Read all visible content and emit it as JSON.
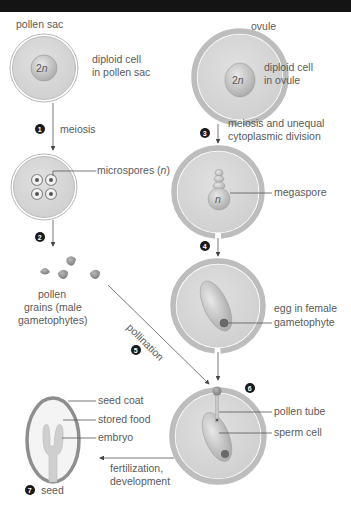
{
  "diagram": {
    "colors": {
      "cell_fill": "#d6d6d6",
      "wall": "#b4b4b4",
      "nucleus": "#c2c2c2",
      "dark": "#6a6a6a",
      "text": "#5a5a5a",
      "badge": "#1a1a1a",
      "top_band": "#141414"
    },
    "left_column": {
      "pollen_sac_label": "pollen sac",
      "diploid_cell_label_line1": "diploid cell",
      "diploid_cell_label_line2": "in pollen sac",
      "nucleus_label": "2",
      "nucleus_label_n": "n",
      "step1_badge": "1",
      "step1_label": "meiosis",
      "microspores_label": "microspores (",
      "microspores_n": "n",
      "microspores_close": ")",
      "step2_badge": "2",
      "pollen_grains_line1": "pollen",
      "pollen_grains_line2": "grains (male",
      "pollen_grains_line3": "gametophytes)"
    },
    "right_column": {
      "ovule_label": "ovule",
      "diploid_cell_label_line1": "diploid cell",
      "diploid_cell_label_line2": "in ovule",
      "nucleus_label": "2",
      "nucleus_label_n": "n",
      "step3_badge": "3",
      "step3_label_line1": "meiosis and unequal",
      "step3_label_line2": "cytoplasmic division",
      "megaspore_n": "n",
      "megaspore_label": "megaspore",
      "step4_badge": "4",
      "egg_label_line1": "egg in female",
      "egg_label_line2": "gametophyte",
      "step6_badge": "6",
      "pollen_tube_label": "pollen tube",
      "sperm_cell_label": "sperm cell"
    },
    "pollination": {
      "label": "pollination",
      "step5_badge": "5"
    },
    "seed": {
      "seed_coat_label": "seed coat",
      "stored_food_label": "stored food",
      "embryo_label": "embryo",
      "fertilization_line1": "fertilization,",
      "fertilization_line2": "development",
      "step7_badge": "7",
      "seed_label": "seed"
    },
    "caption": "Figure (caption cropped)"
  }
}
